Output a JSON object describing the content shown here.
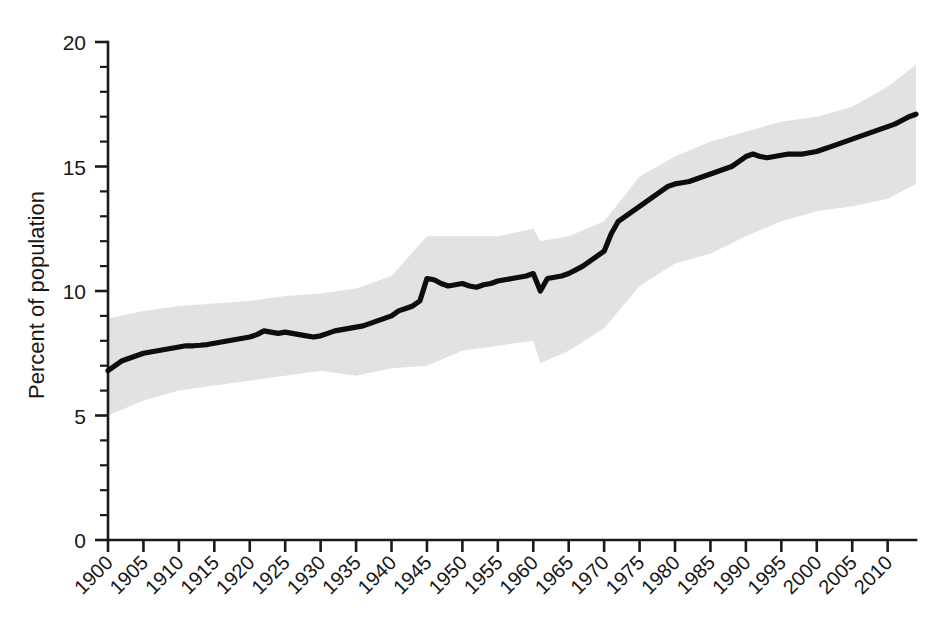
{
  "chart_data": {
    "type": "line",
    "title": "",
    "subtitle": "",
    "xlabel": "",
    "ylabel": "Percent of population",
    "xlim": [
      1900,
      2014
    ],
    "ylim": [
      0,
      20
    ],
    "y_ticks": [
      0,
      5,
      10,
      15,
      20
    ],
    "y_tick_labels": [
      "0",
      "5",
      "10",
      "15",
      "20"
    ],
    "y_minor_tick_step": 1,
    "x_ticks": [
      1900,
      1905,
      1910,
      1915,
      1920,
      1925,
      1930,
      1935,
      1940,
      1945,
      1950,
      1955,
      1960,
      1965,
      1970,
      1975,
      1980,
      1985,
      1990,
      1995,
      2000,
      2005,
      2010
    ],
    "x_tick_labels": [
      "1900",
      "1905",
      "1910",
      "1915",
      "1920",
      "1925",
      "1930",
      "1935",
      "1940",
      "1945",
      "1950",
      "1955",
      "1960",
      "1965",
      "1970",
      "1975",
      "1980",
      "1985",
      "1990",
      "1995",
      "2000",
      "2005",
      "2010"
    ],
    "x_tick_label_rotation": -45,
    "grid": false,
    "legend": null,
    "legend_position": "none",
    "annotations": [],
    "colors": {
      "line": "#0d0d0d",
      "band": "#e2e2e2",
      "axis": "#1a1a1a",
      "background": "#ffffff"
    },
    "series": [
      {
        "name": "Percent of population",
        "style": "line",
        "x": [
          1900,
          1901,
          1902,
          1903,
          1904,
          1905,
          1906,
          1907,
          1908,
          1909,
          1910,
          1911,
          1912,
          1913,
          1914,
          1915,
          1916,
          1917,
          1918,
          1919,
          1920,
          1921,
          1922,
          1923,
          1924,
          1925,
          1926,
          1927,
          1928,
          1929,
          1930,
          1931,
          1932,
          1933,
          1934,
          1935,
          1936,
          1937,
          1938,
          1939,
          1940,
          1941,
          1942,
          1943,
          1944,
          1945,
          1946,
          1947,
          1948,
          1949,
          1950,
          1951,
          1952,
          1953,
          1954,
          1955,
          1956,
          1957,
          1958,
          1959,
          1960,
          1961,
          1962,
          1963,
          1964,
          1965,
          1966,
          1967,
          1968,
          1969,
          1970,
          1971,
          1972,
          1973,
          1974,
          1975,
          1976,
          1977,
          1978,
          1979,
          1980,
          1981,
          1982,
          1983,
          1984,
          1985,
          1986,
          1987,
          1988,
          1989,
          1990,
          1991,
          1992,
          1993,
          1994,
          1995,
          1996,
          1997,
          1998,
          1999,
          2000,
          2001,
          2002,
          2003,
          2004,
          2005,
          2006,
          2007,
          2008,
          2009,
          2010,
          2011,
          2012,
          2013,
          2014
        ],
        "values": [
          6.8,
          7.0,
          7.2,
          7.3,
          7.4,
          7.5,
          7.55,
          7.6,
          7.65,
          7.7,
          7.75,
          7.8,
          7.8,
          7.82,
          7.85,
          7.9,
          7.95,
          8.0,
          8.05,
          8.1,
          8.15,
          8.25,
          8.4,
          8.35,
          8.3,
          8.35,
          8.3,
          8.25,
          8.2,
          8.15,
          8.2,
          8.3,
          8.4,
          8.45,
          8.5,
          8.55,
          8.6,
          8.7,
          8.8,
          8.9,
          9.0,
          9.2,
          9.3,
          9.4,
          9.6,
          10.5,
          10.45,
          10.3,
          10.2,
          10.25,
          10.3,
          10.2,
          10.15,
          10.25,
          10.3,
          10.4,
          10.45,
          10.5,
          10.55,
          10.6,
          10.7,
          10.0,
          10.5,
          10.55,
          10.6,
          10.7,
          10.85,
          11.0,
          11.2,
          11.4,
          11.6,
          12.3,
          12.8,
          13.0,
          13.2,
          13.4,
          13.6,
          13.8,
          14.0,
          14.2,
          14.3,
          14.35,
          14.4,
          14.5,
          14.6,
          14.7,
          14.8,
          14.9,
          15.0,
          15.2,
          15.4,
          15.5,
          15.4,
          15.35,
          15.4,
          15.45,
          15.5,
          15.5,
          15.5,
          15.55,
          15.6,
          15.7,
          15.8,
          15.9,
          16.0,
          16.1,
          16.2,
          16.3,
          16.4,
          16.5,
          16.6,
          16.7,
          16.85,
          17.0,
          17.1
        ]
      }
    ],
    "confidence_band": {
      "name": "uncertainty interval",
      "x": [
        1900,
        1905,
        1910,
        1915,
        1920,
        1925,
        1930,
        1935,
        1940,
        1945,
        1950,
        1955,
        1960,
        1961,
        1965,
        1970,
        1975,
        1980,
        1985,
        1990,
        1995,
        2000,
        2005,
        2010,
        2014
      ],
      "upper": [
        8.9,
        9.2,
        9.4,
        9.5,
        9.6,
        9.8,
        9.9,
        10.1,
        10.6,
        12.2,
        12.2,
        12.2,
        12.5,
        12.0,
        12.2,
        12.8,
        14.6,
        15.4,
        16.0,
        16.4,
        16.8,
        17.0,
        17.4,
        18.2,
        19.1
      ],
      "lower": [
        5.0,
        5.6,
        6.0,
        6.2,
        6.4,
        6.6,
        6.8,
        6.6,
        6.9,
        7.0,
        7.6,
        7.8,
        8.0,
        7.1,
        7.6,
        8.5,
        10.2,
        11.1,
        11.5,
        12.2,
        12.8,
        13.2,
        13.4,
        13.7,
        14.3
      ]
    }
  },
  "meta": {
    "y_axis_title": "Percent of population"
  }
}
